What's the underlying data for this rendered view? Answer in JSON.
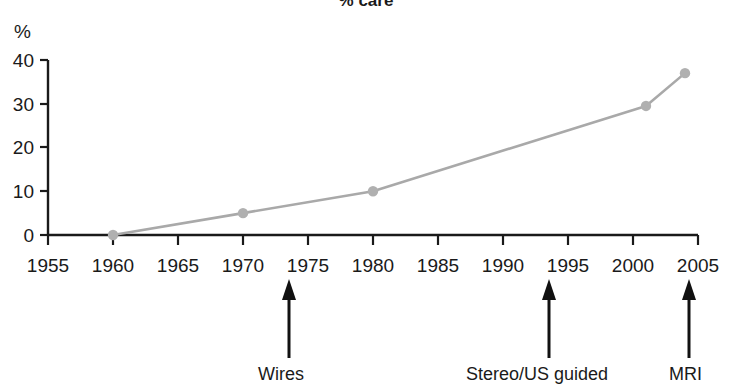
{
  "chart_data": {
    "type": "line",
    "title": "% care",
    "xlabel": "",
    "ylabel": "%",
    "x": [
      1960,
      1970,
      1980,
      2001,
      2004
    ],
    "values": [
      0,
      5,
      10,
      29.5,
      37
    ],
    "series": [
      {
        "name": "% care",
        "x": [
          1960,
          1970,
          1980,
          2001,
          2004
        ],
        "values": [
          0,
          5,
          10,
          29.5,
          37
        ]
      }
    ],
    "xlim": [
      1955,
      2005
    ],
    "ylim": [
      0,
      40
    ],
    "xticks": [
      "1955",
      "1960",
      "1965",
      "1970",
      "1975",
      "1980",
      "1985",
      "1990",
      "1995",
      "2000",
      "2005"
    ],
    "xtick_values": [
      1955,
      1960,
      1965,
      1970,
      1975,
      1980,
      1985,
      1990,
      1995,
      2000,
      2005
    ],
    "yticks": [
      "0",
      "10",
      "20",
      "30",
      "40"
    ],
    "ytick_values": [
      0,
      10,
      20,
      30,
      40
    ],
    "grid": false,
    "legend": "none",
    "line_color": "#a9a9a9",
    "marker_color": "#b0b0b0",
    "axis_color": "#1a1a1a",
    "annotations": [
      {
        "label": "Wires",
        "x": 1973.5
      },
      {
        "label": "Stereo/US guided",
        "x": 1993.5
      },
      {
        "label": "MRI",
        "x": 2004.3
      }
    ]
  },
  "axes": {
    "y_unit_label": "%",
    "y_tick_labels": [
      "40",
      "30",
      "20",
      "10",
      "0"
    ],
    "x_tick_labels": [
      "1955",
      "1960",
      "1965",
      "1970",
      "1975",
      "1980",
      "1985",
      "1990",
      "1995",
      "2000",
      "2005"
    ]
  },
  "annotations": {
    "items": [
      {
        "label": "Wires"
      },
      {
        "label": "Stereo/US guided"
      },
      {
        "label": "MRI"
      }
    ]
  },
  "header": {
    "title": "% care"
  }
}
